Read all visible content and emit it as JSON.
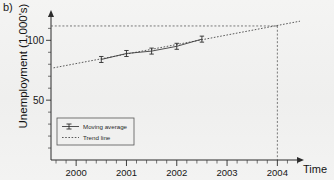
{
  "figure": {
    "panel_label": "b)",
    "background_color": "#f2f2f1",
    "line_color": "#3d3d3d"
  },
  "axes": {
    "ylabel": "Unemployment (1,000's)",
    "xlabel": "Time",
    "ytick_labels": [
      "100",
      "50"
    ],
    "xtick_labels": [
      "2000",
      "2001",
      "2002",
      "2003",
      "2004"
    ]
  },
  "legend": {
    "entries": [
      {
        "label": "Moving average",
        "style": "solid-with-markers"
      },
      {
        "label": "Trend line",
        "style": "dotted"
      }
    ]
  },
  "chart_data": {
    "type": "line",
    "title": "",
    "subtitle": "",
    "xlabel": "Time",
    "ylabel": "Unemployment (1,000's)",
    "xlim": [
      1999.5,
      2004.45
    ],
    "ylim": [
      0,
      122
    ],
    "xticks": [
      2000,
      2001,
      2002,
      2003,
      2004
    ],
    "xtick_labels": [
      "2000",
      "2001",
      "2002",
      "2003",
      "2004"
    ],
    "yticks": [
      50,
      100
    ],
    "ytick_labels": [
      "50",
      "100"
    ],
    "minor_xticks_per_interval": 4,
    "minor_yticks_per_interval": 4,
    "grid": false,
    "legend_position": "lower-left",
    "series": [
      {
        "name": "Moving average",
        "style": "solid",
        "marker": "error-bar",
        "x": [
          2000.5,
          2001.0,
          2001.5,
          2002.0,
          2002.5
        ],
        "values": [
          84,
          89,
          91,
          95,
          101
        ]
      },
      {
        "name": "Trend line",
        "style": "dotted",
        "marker": "none",
        "x": [
          1999.55,
          2004.45
        ],
        "values": [
          77,
          116
        ]
      }
    ],
    "annotations": [
      {
        "type": "vertical-reference-line",
        "style": "dashed",
        "x": 2004,
        "label": "2004"
      },
      {
        "type": "horizontal-reference-line",
        "style": "dashed",
        "y": 112,
        "x_from": 1999.5,
        "x_to": 2004
      }
    ]
  }
}
